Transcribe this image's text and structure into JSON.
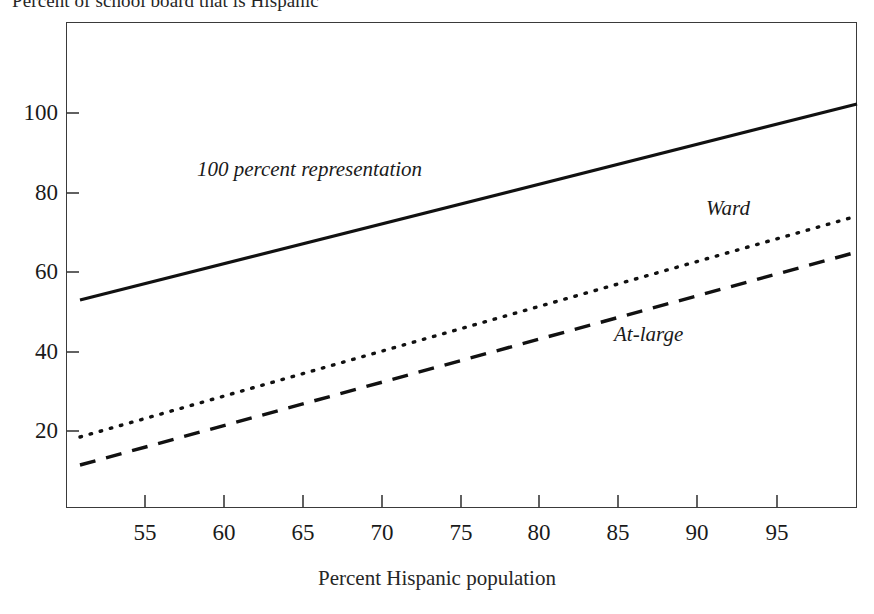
{
  "title": "Percent of school board that is Hispanic",
  "axis": {
    "x_title": "Percent Hispanic population",
    "y_title": "",
    "x_ticks": [
      "55",
      "60",
      "65",
      "70",
      "75",
      "80",
      "85",
      "90",
      "95"
    ],
    "y_ticks": [
      "20",
      "40",
      "60",
      "80",
      "100"
    ]
  },
  "chart_data": {
    "type": "line",
    "title": "Percent of school board that is Hispanic",
    "xlabel": "Percent Hispanic population",
    "ylabel": "Percent of school board that is Hispanic",
    "xlim": [
      50,
      100
    ],
    "ylim": [
      0,
      122
    ],
    "grid": false,
    "legend": "inline-annotations",
    "xticks": [
      55,
      60,
      65,
      70,
      75,
      80,
      85,
      90,
      95
    ],
    "yticks": [
      20,
      40,
      60,
      80,
      100
    ],
    "series": [
      {
        "name": "100 percent representation",
        "style": "solid",
        "x": [
          50.9,
          100.0
        ],
        "values": [
          52.3,
          101.5
        ]
      },
      {
        "name": "Ward",
        "style": "dotted",
        "x": [
          50.9,
          100.0
        ],
        "values": [
          18.0,
          73.5
        ]
      },
      {
        "name": "At-large",
        "style": "dashed",
        "x": [
          50.9,
          100.0
        ],
        "values": [
          11.0,
          64.5
        ]
      }
    ],
    "annotations": [
      {
        "text": "100 percent representation",
        "x": 59.5,
        "y": 83
      },
      {
        "text": "Ward",
        "x": 91.5,
        "y": 74
      },
      {
        "text": "At-large",
        "x": 85.5,
        "y": 43
      }
    ]
  },
  "geometry": {
    "plot": {
      "left": 66,
      "top": 22,
      "right": 857,
      "bottom": 508
    },
    "x_tick_px": [
      145,
      224,
      303,
      382,
      461,
      539,
      618,
      697,
      777
    ],
    "y_tick_px": [
      431,
      352,
      272,
      193,
      113
    ],
    "series_px": [
      {
        "x1": 80,
        "y1": 300,
        "x2": 857,
        "y2": 104
      },
      {
        "x1": 80,
        "y1": 437,
        "x2": 857,
        "y2": 216
      },
      {
        "x1": 80,
        "y1": 465,
        "x2": 857,
        "y2": 252
      }
    ]
  }
}
